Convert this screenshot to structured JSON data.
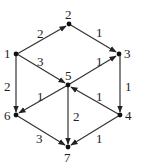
{
  "diagram": {
    "type": "directed-weighted-graph",
    "nodes": [
      {
        "id": "1",
        "label": "1"
      },
      {
        "id": "2",
        "label": "2"
      },
      {
        "id": "3",
        "label": "3"
      },
      {
        "id": "4",
        "label": "4"
      },
      {
        "id": "5",
        "label": "5"
      },
      {
        "id": "6",
        "label": "6"
      },
      {
        "id": "7",
        "label": "7"
      }
    ],
    "edges": [
      {
        "from": "1",
        "to": "2",
        "weight": "2"
      },
      {
        "from": "2",
        "to": "3",
        "weight": "1"
      },
      {
        "from": "1",
        "to": "5",
        "weight": "3"
      },
      {
        "from": "5",
        "to": "3",
        "weight": "1"
      },
      {
        "from": "1",
        "to": "6",
        "weight": "2"
      },
      {
        "from": "3",
        "to": "4",
        "weight": "1"
      },
      {
        "from": "5",
        "to": "6",
        "weight": "1"
      },
      {
        "from": "4",
        "to": "5",
        "weight": "1"
      },
      {
        "from": "5",
        "to": "7",
        "weight": "2"
      },
      {
        "from": "6",
        "to": "7",
        "weight": "3"
      },
      {
        "from": "4",
        "to": "7",
        "weight": "1"
      }
    ]
  }
}
